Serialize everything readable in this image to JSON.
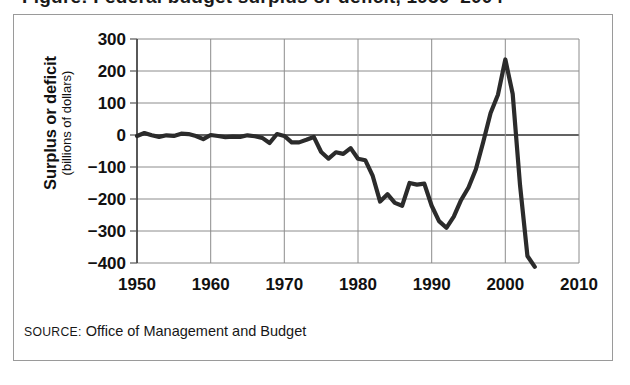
{
  "figure": {
    "title_partial": "Figure: Federal budget surplus or deficit, 1950–2004",
    "source_keyword": "SOURCE:",
    "source_body": " Office of Management and Budget",
    "frame_color": "#9a9a9a",
    "line_color": "#2b2b2b",
    "grid_color": "#8c8c8c",
    "zero_line_color": "#2f2f2f",
    "background": "#ffffff"
  },
  "axes": {
    "y_label_main": "Surplus or deficit",
    "y_label_sub": "(billions of dollars)",
    "y_ticks": [
      "300",
      "200",
      "100",
      "0",
      "−100",
      "−200",
      "−300",
      "−400"
    ],
    "x_ticks": [
      "1950",
      "1960",
      "1970",
      "1980",
      "1990",
      "2000",
      "2010"
    ]
  },
  "chart_data": {
    "type": "line",
    "title": "Federal budget surplus or deficit",
    "xlabel": "",
    "ylabel": "Surplus or deficit (billions of dollars)",
    "xlim": [
      1950,
      2010
    ],
    "ylim": [
      -400,
      300
    ],
    "grid": true,
    "legend": null,
    "y_ticks": [
      300,
      200,
      100,
      0,
      -100,
      -200,
      -300,
      -400
    ],
    "x_ticks": [
      1950,
      1960,
      1970,
      1980,
      1990,
      2000,
      2010
    ],
    "source": "Office of Management and Budget",
    "series": [
      {
        "name": "Surplus or deficit",
        "x": [
          1950,
          1951,
          1952,
          1953,
          1954,
          1955,
          1956,
          1957,
          1958,
          1959,
          1960,
          1961,
          1962,
          1963,
          1964,
          1965,
          1966,
          1967,
          1968,
          1969,
          1970,
          1971,
          1972,
          1973,
          1974,
          1975,
          1976,
          1977,
          1978,
          1979,
          1980,
          1981,
          1982,
          1983,
          1984,
          1985,
          1986,
          1987,
          1988,
          1989,
          1990,
          1991,
          1992,
          1993,
          1994,
          1995,
          1996,
          1997,
          1998,
          1999,
          2000,
          2001,
          2002,
          2003,
          2004
        ],
        "values": [
          -3,
          6,
          -1,
          -6,
          -1,
          -3,
          4,
          3,
          -3,
          -13,
          0,
          -3,
          -7,
          -5,
          -6,
          -1,
          -4,
          -9,
          -25,
          3,
          -3,
          -23,
          -23,
          -15,
          -6,
          -53,
          -74,
          -54,
          -59,
          -41,
          -74,
          -79,
          -128,
          -208,
          -185,
          -212,
          -221,
          -150,
          -155,
          -152,
          -221,
          -269,
          -290,
          -255,
          -203,
          -164,
          -107,
          -22,
          69,
          126,
          236,
          128,
          -158,
          -378,
          -412
        ]
      }
    ]
  }
}
